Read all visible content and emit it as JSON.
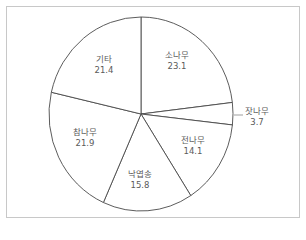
{
  "chart_data": {
    "type": "pie",
    "title": "",
    "unit": "%",
    "categories": [
      "소나무",
      "잣나무",
      "전나무",
      "낙엽송",
      "참나무",
      "기타"
    ],
    "values": [
      23.1,
      3.7,
      14.1,
      15.8,
      21.9,
      21.4
    ],
    "start_angle_deg": 0,
    "direction": "clockwise",
    "labels_inside": true,
    "external_label_with_leader": [
      "잣나무"
    ],
    "colors": {
      "fill": "#ffffff",
      "stroke": "#4a4a4a",
      "text": "#5a5a5a",
      "frame": "#c8c8c8"
    }
  },
  "labels": [
    {
      "name": "소나무",
      "value": "23.1"
    },
    {
      "name": "잣나무",
      "value": "3.7"
    },
    {
      "name": "전나무",
      "value": "14.1"
    },
    {
      "name": "낙엽송",
      "value": "15.8"
    },
    {
      "name": "참나무",
      "value": "21.9"
    },
    {
      "name": "기타",
      "value": "21.4"
    }
  ]
}
